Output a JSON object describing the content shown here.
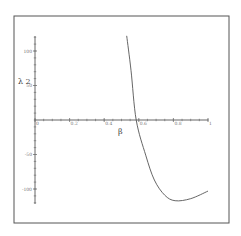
{
  "chart_data": {
    "type": "line",
    "title": "",
    "xlabel": "β",
    "ylabel": "λ 2",
    "xlim": [
      0,
      1
    ],
    "ylim": [
      -120,
      125
    ],
    "grid": false,
    "legend": "none",
    "x_ticks": [
      {
        "value": 0,
        "label": "0"
      },
      {
        "value": 0.2,
        "label": "0.2"
      },
      {
        "value": 0.4,
        "label": "0.4"
      },
      {
        "value": 0.6,
        "label": "0.6"
      },
      {
        "value": 0.8,
        "label": "0.8"
      },
      {
        "value": 1,
        "label": "1"
      }
    ],
    "y_ticks": [
      {
        "value": 100,
        "label": "100"
      },
      {
        "value": 50,
        "label": "50"
      },
      {
        "value": -50,
        "label": "-50"
      },
      {
        "value": -100,
        "label": "-100"
      }
    ],
    "series": [
      {
        "name": "λ2(β)",
        "x": [
          0.53,
          0.555,
          0.585,
          0.64,
          0.69,
          0.75,
          0.81,
          0.9,
          1.0
        ],
        "y": [
          122,
          72,
          0,
          -51,
          -87,
          -109,
          -117,
          -114,
          -103
        ]
      }
    ]
  }
}
